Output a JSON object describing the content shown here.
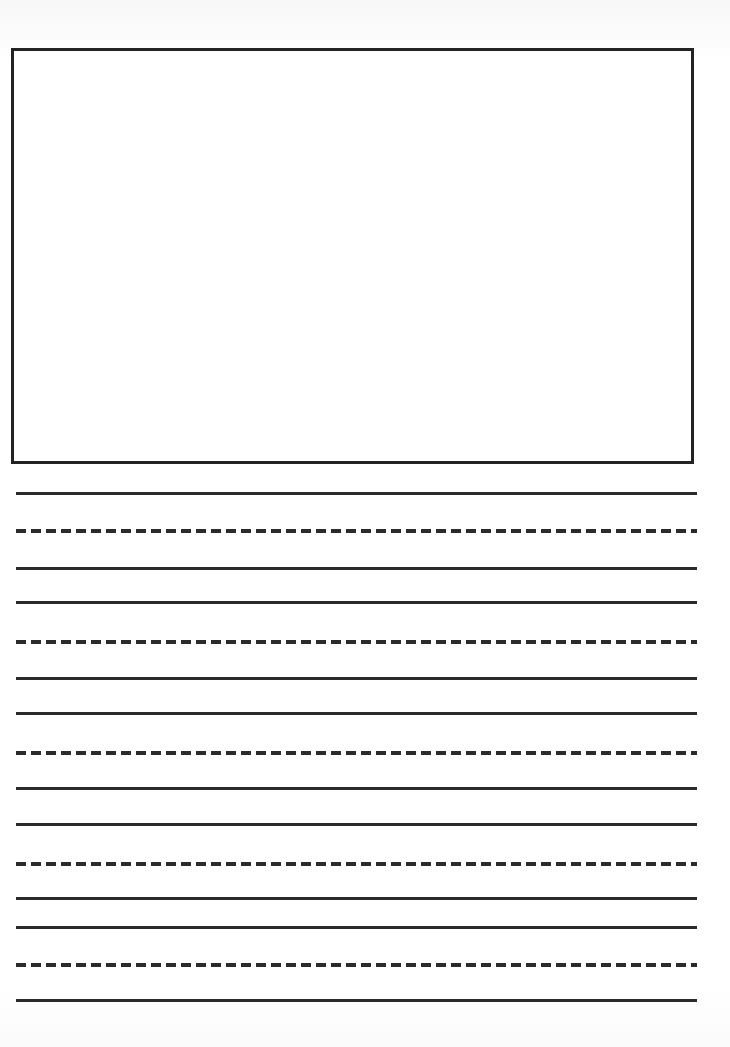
{
  "document": {
    "kind": "handwriting-practice-worksheet",
    "page_width": 730,
    "page_height": 1047,
    "background_color": "#ffffff",
    "ink_color": "#2b2b2b"
  },
  "drawing_box": {
    "label": "",
    "x": 11,
    "y": 48,
    "width": 683,
    "height": 416,
    "border_width": 3,
    "border_color": "#232323"
  },
  "writing_area": {
    "left": 16,
    "right": 697,
    "line_length": 681,
    "solid_thickness": 3,
    "dash_length": 10,
    "dash_gap": 5,
    "dash_thickness": 4,
    "lines": [
      {
        "y": 492,
        "style": "solid"
      },
      {
        "y": 529,
        "style": "dashed"
      },
      {
        "y": 567,
        "style": "solid"
      },
      {
        "y": 601,
        "style": "solid"
      },
      {
        "y": 640,
        "style": "dashed"
      },
      {
        "y": 677,
        "style": "solid"
      },
      {
        "y": 712,
        "style": "solid"
      },
      {
        "y": 751,
        "style": "dashed"
      },
      {
        "y": 787,
        "style": "solid"
      },
      {
        "y": 823,
        "style": "solid"
      },
      {
        "y": 862,
        "style": "dashed"
      },
      {
        "y": 897,
        "style": "solid"
      },
      {
        "y": 926,
        "style": "solid"
      },
      {
        "y": 963,
        "style": "dashed"
      },
      {
        "y": 999,
        "style": "solid"
      }
    ]
  }
}
